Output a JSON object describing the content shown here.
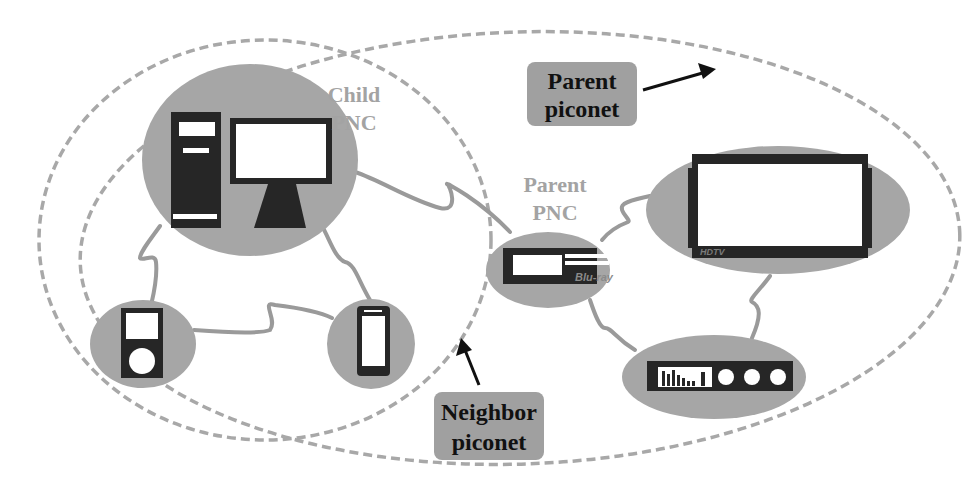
{
  "diagram": {
    "colors": {
      "node_fill": "#a6a6a6",
      "device_dark": "#262626",
      "link": "#9a9a9a",
      "boundary_dash": "#a8a8a8",
      "callout_fill": "#a0a0a0",
      "label_gray": "#a3a3a3"
    },
    "labels": {
      "child_pnc": [
        "Child",
        "PNC"
      ],
      "parent_pnc": [
        "Parent",
        "PNC"
      ]
    },
    "callouts": {
      "parent_piconet": [
        "Parent",
        "piconet"
      ],
      "neighbor_piconet": [
        "Neighbor",
        "piconet"
      ]
    },
    "devices": [
      {
        "id": "desktop-pc",
        "name": "Desktop computer",
        "role": "Child PNC"
      },
      {
        "id": "media-player",
        "name": "Portable media player"
      },
      {
        "id": "smartphone",
        "name": "Smartphone"
      },
      {
        "id": "bluray-player",
        "name": "Blu-ray player",
        "brand": "Blu-ray",
        "role": "Parent PNC"
      },
      {
        "id": "hdtv",
        "name": "HDTV",
        "brand": "HDTV"
      },
      {
        "id": "audio-receiver",
        "name": "Audio receiver / equalizer"
      }
    ],
    "boundaries": [
      {
        "id": "neighbor-piconet",
        "label": "Neighbor piconet"
      },
      {
        "id": "parent-piconet",
        "label": "Parent piconet"
      }
    ]
  }
}
